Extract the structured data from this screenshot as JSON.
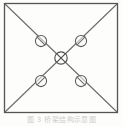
{
  "figure": {
    "caption": "图 3 桥架结构示意图",
    "frame_color": "#555555",
    "line_color": "#6b6b6b",
    "marker_color": "#5a5a5a",
    "background_color": "#fdfdfc"
  },
  "diagram": {
    "type": "schematic",
    "shape": "square-with-diagonals",
    "frame": {
      "label": "outer-square",
      "x": 4.5,
      "y": 3.5,
      "width": 113,
      "height": 109,
      "stroke_width": 1.2
    },
    "diagonals": [
      {
        "label": "diagonal-tl-br",
        "x1": 4.5,
        "y1": 3.5,
        "x2": 117.5,
        "y2": 112.5
      },
      {
        "label": "diagonal-tr-bl",
        "x1": 117.5,
        "y1": 3.5,
        "x2": 4.5,
        "y2": 112.5
      }
    ],
    "center_node": {
      "label": "center-crossed-circle",
      "cx": 61,
      "cy": 58,
      "r": 6.2,
      "has_cross": true
    },
    "nodes": [
      {
        "label": "node-top-left",
        "cx": 41,
        "cy": 41,
        "r": 5.6
      },
      {
        "label": "node-top-right",
        "cx": 81,
        "cy": 41,
        "r": 5.6
      },
      {
        "label": "node-bottom-left",
        "cx": 41,
        "cy": 81,
        "r": 5.6
      },
      {
        "label": "node-bottom-right",
        "cx": 81,
        "cy": 81,
        "r": 5.6
      }
    ]
  }
}
